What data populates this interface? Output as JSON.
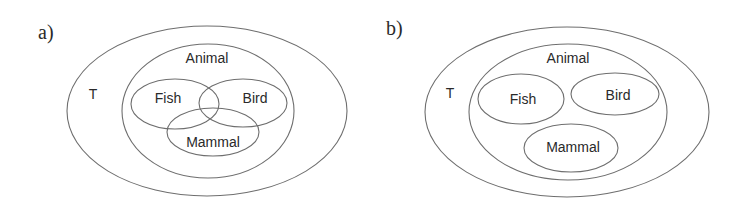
{
  "panels": [
    {
      "id": "a",
      "label": "a)",
      "description": "Overlapping subsets",
      "universe": {
        "label": "T",
        "cx": 207,
        "cy": 111,
        "rx": 140,
        "ry": 85,
        "label_x": 93,
        "label_y": 94
      },
      "parent": {
        "label": "Animal",
        "cx": 208,
        "cy": 111,
        "rx": 86,
        "ry": 67,
        "label_x": 207,
        "label_y": 58
      },
      "subsets": [
        {
          "label": "Fish",
          "cx": 175,
          "cy": 104,
          "rx": 44,
          "ry": 25,
          "label_x": 168,
          "label_y": 98
        },
        {
          "label": "Bird",
          "cx": 243,
          "cy": 103,
          "rx": 44,
          "ry": 24,
          "label_x": 255,
          "label_y": 98
        },
        {
          "label": "Mammal",
          "cx": 213,
          "cy": 132,
          "rx": 46,
          "ry": 24,
          "label_x": 213,
          "label_y": 142
        }
      ],
      "panel_label_x": 38,
      "panel_label_y": 32
    },
    {
      "id": "b",
      "label": "b)",
      "description": "Disjoint subsets",
      "universe": {
        "label": "T",
        "cx": 567,
        "cy": 112,
        "rx": 142,
        "ry": 85,
        "label_x": 450,
        "label_y": 93
      },
      "parent": {
        "label": "Animal",
        "cx": 568,
        "cy": 112,
        "rx": 99,
        "ry": 68,
        "label_x": 568,
        "label_y": 58
      },
      "subsets": [
        {
          "label": "Fish",
          "cx": 521,
          "cy": 99,
          "rx": 43,
          "ry": 25,
          "label_x": 523,
          "label_y": 99
        },
        {
          "label": "Bird",
          "cx": 615,
          "cy": 94,
          "rx": 44,
          "ry": 21,
          "label_x": 618,
          "label_y": 95
        },
        {
          "label": "Mammal",
          "cx": 571,
          "cy": 148,
          "rx": 47,
          "ry": 24,
          "label_x": 573,
          "label_y": 147
        }
      ],
      "panel_label_x": 386,
      "panel_label_y": 28
    }
  ],
  "colors": {
    "stroke": "#6e6e6e",
    "text": "#2a2a2a",
    "background": "#ffffff"
  }
}
